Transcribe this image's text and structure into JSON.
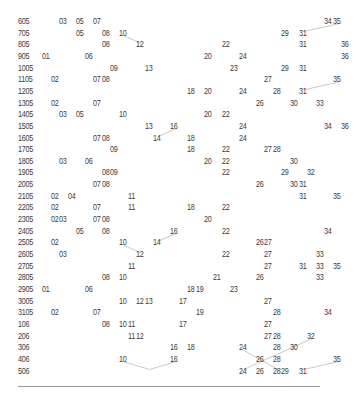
{
  "chart_data": {
    "type": "table",
    "title": "",
    "xlabel": "",
    "ylabel": "",
    "number_range": [
      1,
      35
    ],
    "clipped_right_edge": true,
    "rows": [
      {
        "id": "605",
        "numbers": [
          3,
          5,
          7,
          34,
          35
        ]
      },
      {
        "id": "705",
        "numbers": [
          5,
          8,
          10,
          29,
          31
        ]
      },
      {
        "id": "805",
        "numbers": [
          8,
          12,
          22,
          31,
          36
        ]
      },
      {
        "id": "905",
        "numbers": [
          1,
          6,
          20,
          24,
          36
        ]
      },
      {
        "id": "1005",
        "numbers": [
          9,
          13,
          23,
          29,
          31
        ]
      },
      {
        "id": "1105",
        "numbers": [
          2,
          7,
          8,
          27,
          35
        ]
      },
      {
        "id": "1205",
        "numbers": [
          18,
          20,
          24,
          28,
          31
        ]
      },
      {
        "id": "1305",
        "numbers": [
          2,
          7,
          26,
          30,
          33
        ]
      },
      {
        "id": "1405",
        "numbers": [
          3,
          5,
          10,
          20,
          22
        ]
      },
      {
        "id": "1505",
        "numbers": [
          13,
          16,
          24,
          34,
          36
        ]
      },
      {
        "id": "1605",
        "numbers": [
          7,
          8,
          14,
          18,
          24
        ]
      },
      {
        "id": "1705",
        "numbers": [
          9,
          18,
          22,
          27,
          28
        ]
      },
      {
        "id": "1805",
        "numbers": [
          3,
          6,
          20,
          22,
          30
        ]
      },
      {
        "id": "1905",
        "numbers": [
          8,
          9,
          22,
          29,
          32
        ]
      },
      {
        "id": "2005",
        "numbers": [
          7,
          8,
          26,
          30,
          31
        ]
      },
      {
        "id": "2105",
        "numbers": [
          2,
          4,
          11,
          31,
          35
        ]
      },
      {
        "id": "2205",
        "numbers": [
          2,
          7,
          11,
          18,
          22
        ]
      },
      {
        "id": "2305",
        "numbers": [
          2,
          3,
          7,
          8,
          20
        ]
      },
      {
        "id": "2405",
        "numbers": [
          5,
          8,
          16,
          22,
          34
        ]
      },
      {
        "id": "2505",
        "numbers": [
          2,
          10,
          14,
          26,
          27
        ]
      },
      {
        "id": "2605",
        "numbers": [
          3,
          12,
          22,
          27,
          33
        ]
      },
      {
        "id": "2705",
        "numbers": [
          11,
          27,
          31,
          33,
          35
        ]
      },
      {
        "id": "2805",
        "numbers": [
          8,
          10,
          21,
          26,
          33
        ]
      },
      {
        "id": "2905",
        "numbers": [
          1,
          6,
          18,
          19,
          23
        ]
      },
      {
        "id": "3005",
        "numbers": [
          10,
          12,
          13,
          17,
          27
        ]
      },
      {
        "id": "3105",
        "numbers": [
          2,
          7,
          19,
          28,
          34
        ]
      },
      {
        "id": "106",
        "numbers": [
          8,
          10,
          11,
          17,
          27
        ]
      },
      {
        "id": "206",
        "numbers": [
          11,
          12,
          27,
          28,
          32
        ]
      },
      {
        "id": "306",
        "numbers": [
          16,
          18,
          24,
          28,
          30
        ]
      },
      {
        "id": "406",
        "numbers": [
          10,
          16,
          26,
          28,
          35
        ]
      },
      {
        "id": "506",
        "numbers": [
          24,
          26,
          28,
          29,
          31
        ]
      }
    ],
    "connector_lines": [
      {
        "from": [
          "605",
          35
        ],
        "to": [
          "705",
          31
        ]
      },
      {
        "from": [
          "705",
          10
        ],
        "to": [
          "805",
          12
        ]
      },
      {
        "from": [
          "1105",
          35
        ],
        "to": [
          "1205",
          31
        ]
      },
      {
        "from": [
          "1505",
          16
        ],
        "to": [
          "1605",
          14
        ]
      },
      {
        "from": [
          "2405",
          16
        ],
        "to": [
          "2505",
          14
        ]
      },
      {
        "from": [
          "2505",
          10
        ],
        "to": [
          "2605",
          12
        ]
      },
      {
        "from": [
          "206",
          32
        ],
        "to": [
          "506",
          24
        ]
      },
      {
        "from": [
          "306",
          24
        ],
        "to": [
          "506",
          28
        ]
      },
      {
        "from": [
          "406",
          10
        ],
        "to": [
          "506",
          13
        ]
      },
      {
        "from": [
          "406",
          16
        ],
        "to": [
          "506",
          13
        ]
      },
      {
        "from": [
          "406",
          35
        ],
        "to": [
          "506",
          31
        ]
      }
    ],
    "colors": {
      "text": "#3a3a3a",
      "line": "#c8c8c8",
      "baseline": "#9a9a9a"
    }
  }
}
